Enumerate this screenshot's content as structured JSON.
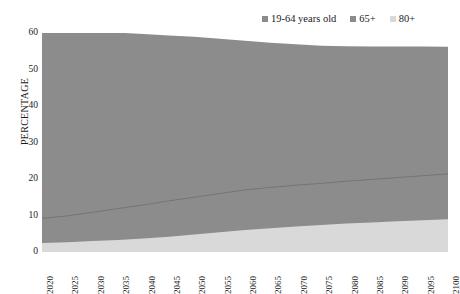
{
  "chart_data": {
    "type": "area",
    "stacked": true,
    "title": "",
    "xlabel": "",
    "ylabel": "PERCENTAGE",
    "ylim": [
      0,
      60
    ],
    "yticks": [
      0,
      10,
      20,
      30,
      40,
      50,
      60
    ],
    "grid": false,
    "legend_position": "top-right",
    "x": [
      2020,
      2025,
      2030,
      2035,
      2040,
      2045,
      2050,
      2055,
      2060,
      2065,
      2070,
      2075,
      2080,
      2085,
      2090,
      2095,
      2100
    ],
    "categories": [
      "2020",
      "2025",
      "2030",
      "2035",
      "2040",
      "2045",
      "2050",
      "2055",
      "2060",
      "2065",
      "2070",
      "2075",
      "2080",
      "2085",
      "2090",
      "2095",
      "2100"
    ],
    "series": [
      {
        "name": "19-64 years old",
        "color": "#8c8c8c",
        "values": [
          50.8,
          50.4,
          49.5,
          48.2,
          46.8,
          45.3,
          44.0,
          42.4,
          40.9,
          39.6,
          38.6,
          37.7,
          37.0,
          36.4,
          35.9,
          35.4,
          34.8
        ]
      },
      {
        "name": "65+",
        "color": "#8c8c8c",
        "values": [
          6.7,
          7.2,
          7.9,
          8.6,
          9.2,
          9.8,
          10.2,
          10.6,
          11.0,
          11.2,
          11.3,
          11.4,
          11.6,
          11.8,
          12.0,
          12.2,
          12.4
        ]
      },
      {
        "name": "80+",
        "color": "#d9d9d9",
        "values": [
          2.5,
          2.7,
          3.0,
          3.3,
          3.7,
          4.2,
          4.8,
          5.4,
          6.0,
          6.5,
          7.0,
          7.4,
          7.8,
          8.1,
          8.4,
          8.7,
          9.0
        ]
      }
    ],
    "cumulative": {
      "80plus_top": [
        2.5,
        2.7,
        3.0,
        3.3,
        3.7,
        4.2,
        4.8,
        5.4,
        6.0,
        6.5,
        7.0,
        7.4,
        7.8,
        8.1,
        8.4,
        8.7,
        9.0
      ],
      "65plus_top": [
        9.2,
        9.9,
        10.9,
        11.9,
        12.9,
        14.0,
        15.0,
        16.0,
        17.0,
        17.7,
        18.3,
        18.8,
        19.4,
        19.9,
        20.4,
        20.9,
        21.4
      ],
      "total_top": [
        60.0,
        60.3,
        60.4,
        60.1,
        59.7,
        59.3,
        59.0,
        58.4,
        57.9,
        57.3,
        56.9,
        56.5,
        56.4,
        56.3,
        56.3,
        56.3,
        56.2
      ]
    }
  },
  "legend": {
    "items": [
      {
        "label": "19-64 years old",
        "color": "#8c8c8c"
      },
      {
        "label": "65+",
        "color": "#8c8c8c"
      },
      {
        "label": "80+",
        "color": "#d9d9d9"
      }
    ]
  },
  "axes": {
    "y_title": "PERCENTAGE",
    "y_ticks": [
      "60",
      "50",
      "40",
      "30",
      "20",
      "10",
      "0"
    ],
    "x_ticks": [
      "2020",
      "2025",
      "2030",
      "2035",
      "2040",
      "2045",
      "2050",
      "2055",
      "2060",
      "2065",
      "2070",
      "2075",
      "2080",
      "2085",
      "2090",
      "2095",
      "2100"
    ]
  },
  "colors": {
    "series_19_64": "#8c8c8c",
    "series_65plus": "#8c8c8c",
    "series_80plus": "#d9d9d9",
    "background": "#ffffff",
    "text": "#1a1a1a"
  }
}
